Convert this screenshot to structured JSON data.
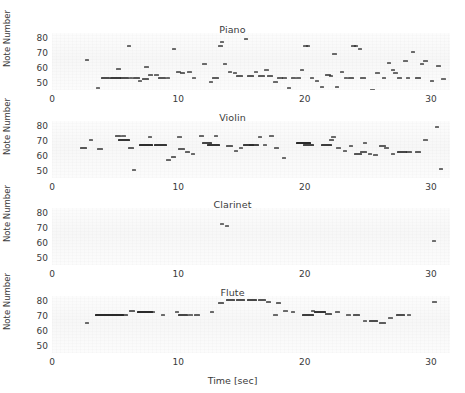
{
  "figure": {
    "xlabel": "Time [sec]",
    "ylabel": "Note Number",
    "xticks": [
      0,
      10,
      20,
      30
    ],
    "yticks": [
      50,
      60,
      70,
      80
    ],
    "xlim": [
      0,
      31.5
    ],
    "ylim": [
      45,
      83
    ],
    "panel_titles": [
      "Piano",
      "Violin",
      "Clarinet",
      "Flute"
    ]
  },
  "chart_data": {
    "type": "scatter",
    "title": "",
    "subtitle": "",
    "xlabel": "Time [sec]",
    "ylabel": "Note Number",
    "xlim": [
      0,
      31.5
    ],
    "ylim": [
      45,
      83
    ],
    "xticks": [
      0,
      10,
      20,
      30
    ],
    "yticks": [
      50,
      60,
      70,
      80
    ],
    "grid": false,
    "legend": "none",
    "panels": [
      {
        "name": "Piano",
        "title": "Piano",
        "notes": [
          {
            "t": 2.6,
            "dur": 0.35,
            "n": 66
          },
          {
            "t": 3.5,
            "dur": 0.3,
            "n": 47
          },
          {
            "t": 3.9,
            "dur": 0.7,
            "n": 54
          },
          {
            "t": 4.6,
            "dur": 0.9,
            "n": 54
          },
          {
            "t": 5.1,
            "dur": 0.35,
            "n": 60
          },
          {
            "t": 5.4,
            "dur": 0.7,
            "n": 54
          },
          {
            "t": 5.9,
            "dur": 0.35,
            "n": 75
          },
          {
            "t": 6.1,
            "dur": 0.35,
            "n": 54
          },
          {
            "t": 6.4,
            "dur": 0.6,
            "n": 54
          },
          {
            "t": 6.8,
            "dur": 0.35,
            "n": 52
          },
          {
            "t": 7.1,
            "dur": 0.55,
            "n": 53
          },
          {
            "t": 7.3,
            "dur": 0.35,
            "n": 61
          },
          {
            "t": 7.6,
            "dur": 0.4,
            "n": 56
          },
          {
            "t": 8.1,
            "dur": 0.35,
            "n": 56
          },
          {
            "t": 8.4,
            "dur": 0.6,
            "n": 54
          },
          {
            "t": 9.0,
            "dur": 0.35,
            "n": 54
          },
          {
            "t": 9.5,
            "dur": 0.35,
            "n": 73
          },
          {
            "t": 9.8,
            "dur": 0.4,
            "n": 58
          },
          {
            "t": 10.1,
            "dur": 0.45,
            "n": 57
          },
          {
            "t": 10.7,
            "dur": 0.35,
            "n": 58
          },
          {
            "t": 11.1,
            "dur": 0.3,
            "n": 54
          },
          {
            "t": 11.9,
            "dur": 0.35,
            "n": 63
          },
          {
            "t": 12.4,
            "dur": 0.35,
            "n": 51
          },
          {
            "t": 12.7,
            "dur": 0.5,
            "n": 54
          },
          {
            "t": 13.1,
            "dur": 0.4,
            "n": 75
          },
          {
            "t": 13.3,
            "dur": 0.35,
            "n": 78
          },
          {
            "t": 13.5,
            "dur": 0.35,
            "n": 63
          },
          {
            "t": 13.9,
            "dur": 0.35,
            "n": 58
          },
          {
            "t": 14.3,
            "dur": 0.35,
            "n": 57
          },
          {
            "t": 14.6,
            "dur": 0.55,
            "n": 55
          },
          {
            "t": 15.2,
            "dur": 0.35,
            "n": 80
          },
          {
            "t": 15.4,
            "dur": 0.6,
            "n": 55
          },
          {
            "t": 16.0,
            "dur": 0.3,
            "n": 58
          },
          {
            "t": 16.3,
            "dur": 0.55,
            "n": 55
          },
          {
            "t": 16.8,
            "dur": 0.35,
            "n": 59
          },
          {
            "t": 17.0,
            "dur": 0.5,
            "n": 55
          },
          {
            "t": 17.5,
            "dur": 0.35,
            "n": 51
          },
          {
            "t": 17.8,
            "dur": 0.45,
            "n": 54
          },
          {
            "t": 18.2,
            "dur": 0.4,
            "n": 54
          },
          {
            "t": 18.6,
            "dur": 0.35,
            "n": 47
          },
          {
            "t": 18.9,
            "dur": 0.45,
            "n": 54
          },
          {
            "t": 19.3,
            "dur": 0.4,
            "n": 54
          },
          {
            "t": 19.6,
            "dur": 0.35,
            "n": 59
          },
          {
            "t": 19.9,
            "dur": 0.35,
            "n": 75
          },
          {
            "t": 20.1,
            "dur": 0.35,
            "n": 75
          },
          {
            "t": 20.4,
            "dur": 0.35,
            "n": 54
          },
          {
            "t": 20.8,
            "dur": 0.35,
            "n": 52
          },
          {
            "t": 21.2,
            "dur": 0.35,
            "n": 48
          },
          {
            "t": 21.6,
            "dur": 0.5,
            "n": 56
          },
          {
            "t": 21.9,
            "dur": 0.35,
            "n": 55
          },
          {
            "t": 22.2,
            "dur": 0.35,
            "n": 70
          },
          {
            "t": 22.4,
            "dur": 0.35,
            "n": 48
          },
          {
            "t": 22.8,
            "dur": 0.35,
            "n": 58
          },
          {
            "t": 23.1,
            "dur": 0.35,
            "n": 54
          },
          {
            "t": 23.4,
            "dur": 0.5,
            "n": 54
          },
          {
            "t": 23.7,
            "dur": 0.4,
            "n": 75
          },
          {
            "t": 23.9,
            "dur": 0.35,
            "n": 75
          },
          {
            "t": 24.2,
            "dur": 0.35,
            "n": 73
          },
          {
            "t": 24.4,
            "dur": 0.45,
            "n": 54
          },
          {
            "t": 25.2,
            "dur": 0.35,
            "n": 46
          },
          {
            "t": 25.6,
            "dur": 0.35,
            "n": 57
          },
          {
            "t": 26.1,
            "dur": 0.35,
            "n": 54
          },
          {
            "t": 26.5,
            "dur": 0.35,
            "n": 64
          },
          {
            "t": 26.8,
            "dur": 0.35,
            "n": 59
          },
          {
            "t": 27.0,
            "dur": 0.35,
            "n": 57
          },
          {
            "t": 27.3,
            "dur": 0.4,
            "n": 54
          },
          {
            "t": 27.8,
            "dur": 0.35,
            "n": 65
          },
          {
            "t": 28.0,
            "dur": 0.35,
            "n": 54
          },
          {
            "t": 28.4,
            "dur": 0.35,
            "n": 71
          },
          {
            "t": 28.7,
            "dur": 0.5,
            "n": 54
          },
          {
            "t": 29.1,
            "dur": 0.35,
            "n": 63
          },
          {
            "t": 29.4,
            "dur": 0.35,
            "n": 65
          },
          {
            "t": 29.9,
            "dur": 0.35,
            "n": 52
          },
          {
            "t": 30.4,
            "dur": 0.35,
            "n": 62
          },
          {
            "t": 30.8,
            "dur": 0.35,
            "n": 53
          }
        ]
      },
      {
        "name": "Violin",
        "title": "Violin",
        "notes": [
          {
            "t": 2.2,
            "dur": 0.6,
            "n": 66
          },
          {
            "t": 2.9,
            "dur": 0.35,
            "n": 71
          },
          {
            "t": 3.6,
            "dur": 0.45,
            "n": 65
          },
          {
            "t": 5.0,
            "dur": 0.5,
            "n": 74
          },
          {
            "t": 5.5,
            "dur": 0.35,
            "n": 74
          },
          {
            "t": 5.2,
            "dur": 1.0,
            "n": 71
          },
          {
            "t": 6.0,
            "dur": 0.5,
            "n": 66
          },
          {
            "t": 6.3,
            "dur": 0.35,
            "n": 51
          },
          {
            "t": 6.9,
            "dur": 1.1,
            "n": 68
          },
          {
            "t": 7.6,
            "dur": 0.35,
            "n": 73
          },
          {
            "t": 8.1,
            "dur": 1.0,
            "n": 68
          },
          {
            "t": 9.0,
            "dur": 0.4,
            "n": 58
          },
          {
            "t": 9.4,
            "dur": 0.45,
            "n": 60
          },
          {
            "t": 9.9,
            "dur": 0.35,
            "n": 73
          },
          {
            "t": 10.0,
            "dur": 0.5,
            "n": 65
          },
          {
            "t": 10.5,
            "dur": 0.45,
            "n": 63
          },
          {
            "t": 11.0,
            "dur": 0.35,
            "n": 62
          },
          {
            "t": 11.6,
            "dur": 0.4,
            "n": 74
          },
          {
            "t": 11.9,
            "dur": 0.8,
            "n": 69
          },
          {
            "t": 12.3,
            "dur": 1.0,
            "n": 68
          },
          {
            "t": 12.8,
            "dur": 0.35,
            "n": 74
          },
          {
            "t": 13.8,
            "dur": 0.55,
            "n": 67
          },
          {
            "t": 14.4,
            "dur": 0.35,
            "n": 64
          },
          {
            "t": 14.8,
            "dur": 0.35,
            "n": 66
          },
          {
            "t": 15.1,
            "dur": 0.9,
            "n": 68
          },
          {
            "t": 15.6,
            "dur": 0.8,
            "n": 68
          },
          {
            "t": 16.3,
            "dur": 0.35,
            "n": 73
          },
          {
            "t": 16.7,
            "dur": 0.35,
            "n": 68
          },
          {
            "t": 17.2,
            "dur": 0.35,
            "n": 74
          },
          {
            "t": 17.6,
            "dur": 0.4,
            "n": 66
          },
          {
            "t": 18.2,
            "dur": 0.35,
            "n": 59
          },
          {
            "t": 19.3,
            "dur": 1.2,
            "n": 69
          },
          {
            "t": 19.9,
            "dur": 0.8,
            "n": 68
          },
          {
            "t": 21.3,
            "dur": 0.9,
            "n": 68
          },
          {
            "t": 21.9,
            "dur": 0.45,
            "n": 71
          },
          {
            "t": 22.1,
            "dur": 0.35,
            "n": 73
          },
          {
            "t": 22.5,
            "dur": 0.35,
            "n": 66
          },
          {
            "t": 23.0,
            "dur": 0.35,
            "n": 64
          },
          {
            "t": 23.5,
            "dur": 0.35,
            "n": 67
          },
          {
            "t": 23.9,
            "dur": 0.6,
            "n": 62
          },
          {
            "t": 24.4,
            "dur": 0.55,
            "n": 63
          },
          {
            "t": 24.6,
            "dur": 0.35,
            "n": 69
          },
          {
            "t": 25.0,
            "dur": 0.35,
            "n": 62
          },
          {
            "t": 25.4,
            "dur": 0.4,
            "n": 61
          },
          {
            "t": 25.9,
            "dur": 0.5,
            "n": 67
          },
          {
            "t": 26.3,
            "dur": 0.35,
            "n": 66
          },
          {
            "t": 26.8,
            "dur": 0.35,
            "n": 62
          },
          {
            "t": 27.3,
            "dur": 0.8,
            "n": 63
          },
          {
            "t": 28.0,
            "dur": 0.5,
            "n": 63
          },
          {
            "t": 28.7,
            "dur": 0.5,
            "n": 63
          },
          {
            "t": 29.4,
            "dur": 0.35,
            "n": 71
          },
          {
            "t": 30.3,
            "dur": 0.35,
            "n": 80
          },
          {
            "t": 30.6,
            "dur": 0.35,
            "n": 52
          }
        ]
      },
      {
        "name": "Clarinet",
        "title": "Clarinet",
        "notes": [
          {
            "t": 13.3,
            "dur": 0.3,
            "n": 73
          },
          {
            "t": 13.7,
            "dur": 0.3,
            "n": 72
          },
          {
            "t": 30.1,
            "dur": 0.3,
            "n": 62
          }
        ]
      },
      {
        "name": "Flute",
        "title": "Flute",
        "notes": [
          {
            "t": 2.6,
            "dur": 0.35,
            "n": 66
          },
          {
            "t": 3.4,
            "dur": 1.4,
            "n": 71
          },
          {
            "t": 4.4,
            "dur": 1.3,
            "n": 71
          },
          {
            "t": 5.5,
            "dur": 0.5,
            "n": 71
          },
          {
            "t": 6.1,
            "dur": 0.5,
            "n": 74
          },
          {
            "t": 6.7,
            "dur": 1.3,
            "n": 73
          },
          {
            "t": 7.8,
            "dur": 0.35,
            "n": 73
          },
          {
            "t": 8.6,
            "dur": 0.35,
            "n": 71
          },
          {
            "t": 9.7,
            "dur": 0.35,
            "n": 73
          },
          {
            "t": 10.0,
            "dur": 0.8,
            "n": 71
          },
          {
            "t": 10.8,
            "dur": 0.35,
            "n": 71
          },
          {
            "t": 11.2,
            "dur": 0.5,
            "n": 71
          },
          {
            "t": 12.5,
            "dur": 0.35,
            "n": 73
          },
          {
            "t": 13.1,
            "dur": 0.5,
            "n": 79
          },
          {
            "t": 13.8,
            "dur": 0.7,
            "n": 81
          },
          {
            "t": 14.6,
            "dur": 0.7,
            "n": 81
          },
          {
            "t": 15.4,
            "dur": 0.8,
            "n": 81
          },
          {
            "t": 16.3,
            "dur": 0.6,
            "n": 81
          },
          {
            "t": 16.9,
            "dur": 0.4,
            "n": 80
          },
          {
            "t": 17.5,
            "dur": 0.35,
            "n": 71
          },
          {
            "t": 17.7,
            "dur": 0.45,
            "n": 79
          },
          {
            "t": 18.3,
            "dur": 0.35,
            "n": 74
          },
          {
            "t": 18.9,
            "dur": 0.35,
            "n": 73
          },
          {
            "t": 19.8,
            "dur": 0.9,
            "n": 71
          },
          {
            "t": 20.5,
            "dur": 0.35,
            "n": 74
          },
          {
            "t": 20.7,
            "dur": 1.0,
            "n": 73
          },
          {
            "t": 21.6,
            "dur": 0.6,
            "n": 72
          },
          {
            "t": 22.4,
            "dur": 0.4,
            "n": 73
          },
          {
            "t": 23.3,
            "dur": 0.35,
            "n": 71
          },
          {
            "t": 23.8,
            "dur": 0.6,
            "n": 71
          },
          {
            "t": 24.6,
            "dur": 0.35,
            "n": 67
          },
          {
            "t": 25.1,
            "dur": 0.7,
            "n": 67
          },
          {
            "t": 25.9,
            "dur": 0.5,
            "n": 66
          },
          {
            "t": 26.6,
            "dur": 0.35,
            "n": 69
          },
          {
            "t": 27.2,
            "dur": 0.7,
            "n": 71
          },
          {
            "t": 28.1,
            "dur": 0.35,
            "n": 71
          },
          {
            "t": 30.1,
            "dur": 0.35,
            "n": 80
          }
        ]
      }
    ]
  }
}
